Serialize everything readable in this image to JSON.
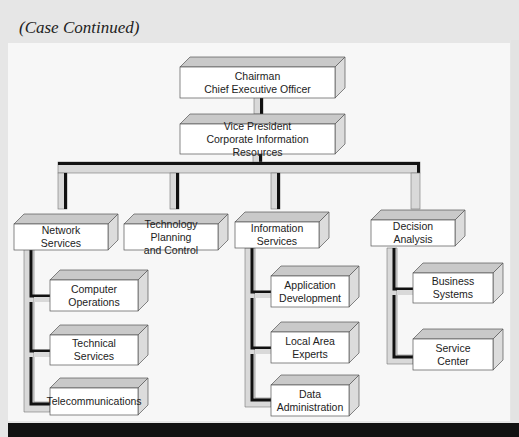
{
  "page": {
    "heading": "(Case Continued)"
  },
  "org_chart": {
    "top": {
      "line1": "Chairman",
      "line2": "Chief Executive Officer"
    },
    "vp": {
      "line1": "Vice President",
      "line2": "Corporate Information Resources"
    },
    "departments": [
      {
        "line1": "Network",
        "line2": "Services",
        "children": [
          {
            "line1": "Computer",
            "line2": "Operations"
          },
          {
            "line1": "Technical",
            "line2": "Services"
          },
          {
            "line1": "Telecommunications",
            "line2": ""
          }
        ]
      },
      {
        "line1": "Technology Planning",
        "line2": "and Control",
        "children": []
      },
      {
        "line1": "Information",
        "line2": "Services",
        "children": [
          {
            "line1": "Application",
            "line2": "Development"
          },
          {
            "line1": "Local Area",
            "line2": "Experts"
          },
          {
            "line1": "Data",
            "line2": "Administration"
          }
        ]
      },
      {
        "line1": "Decision",
        "line2": "Analysis",
        "children": [
          {
            "line1": "Business",
            "line2": "Systems"
          },
          {
            "line1": "Service",
            "line2": "Center"
          }
        ]
      }
    ]
  },
  "colors": {
    "box_face": "#ffffff",
    "box_top": "#c9c9c9",
    "box_side": "#dcdcdc",
    "connector_light": "#d9d9d9",
    "connector_dark": "#111111",
    "page_bg": "#e6e6e6",
    "panel_bg": "#f7f7f7"
  }
}
